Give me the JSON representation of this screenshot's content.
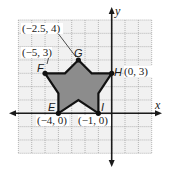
{
  "figure": {
    "type": "coordinate-plane-star",
    "grid": {
      "x_min": -7,
      "x_max": 3,
      "y_min": -3,
      "y_max": 7,
      "step": 1,
      "fill_color": "#f1f1f1",
      "line_color": "#9a9a9a"
    },
    "axes": {
      "x_label": "x",
      "y_label": "y",
      "color": "#1a1a1a"
    },
    "shape": {
      "fill_color": "#8c8c8c",
      "stroke_color": "#111111",
      "polygon": [
        [
          -2.5,
          4
        ],
        [
          -1.5,
          3
        ],
        [
          0,
          3
        ],
        [
          -1,
          1.5
        ],
        [
          -1,
          0
        ],
        [
          -2.5,
          1
        ],
        [
          -4,
          0
        ],
        [
          -4,
          1.5
        ],
        [
          -5,
          3
        ],
        [
          -3.5,
          3
        ]
      ]
    },
    "vertices": [
      {
        "name": "G",
        "coord_label": "(−2.5, 4)",
        "x": -2.5,
        "y": 4
      },
      {
        "name": "F",
        "coord_label": "(−5, 3)",
        "x": -5,
        "y": 3
      },
      {
        "name": "H",
        "coord_label": "(0, 3)",
        "x": 0,
        "y": 3
      },
      {
        "name": "E",
        "coord_label": "(−4, 0)",
        "x": -4,
        "y": 0
      },
      {
        "name": "I",
        "coord_label": "(−1, 0)",
        "x": -1,
        "y": 0
      }
    ]
  }
}
